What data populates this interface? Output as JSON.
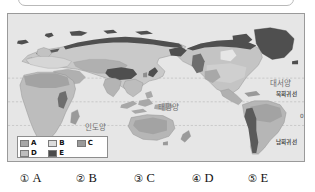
{
  "question_box": {
    "content": ""
  },
  "map": {
    "title_alt": "world-climate-distribution-map",
    "ocean_labels": [
      {
        "name": "pacific-ocean-label",
        "text": "태평양"
      },
      {
        "name": "indian-ocean-label",
        "text": "인도양"
      },
      {
        "name": "atlantic-ocean-label",
        "text": "대서양"
      }
    ],
    "latitude_labels": [
      {
        "name": "tropic-of-cancer-label",
        "text": "북회귀선"
      },
      {
        "name": "equator-label",
        "text": "0°"
      },
      {
        "name": "tropic-of-capricorn-label",
        "text": "남회귀선"
      }
    ],
    "legend": {
      "rows": [
        [
          {
            "label": "A",
            "color": "#a8a8a8"
          },
          {
            "label": "B",
            "color": "#dcdcdc"
          },
          {
            "label": "C",
            "color": "#9a9a9a"
          }
        ],
        [
          {
            "label": "D",
            "color": "#bdbdbd"
          },
          {
            "label": "E",
            "color": "#4a4a4a"
          },
          {
            "label": "",
            "color": ""
          }
        ]
      ]
    },
    "colors": {
      "ocean": "#e6e6e6",
      "land_light": "#dcdcdc",
      "land_mid": "#bdbdbd",
      "land_gray": "#a8a8a8",
      "land_dark_gray": "#9a9a9a",
      "land_darkest": "#4a4a4a",
      "frame": "#9a9a9a",
      "graticule": "#b4b4b4"
    }
  },
  "options": [
    {
      "num": "①",
      "label": "A"
    },
    {
      "num": "②",
      "label": "B"
    },
    {
      "num": "③",
      "label": "C"
    },
    {
      "num": "④",
      "label": "D"
    },
    {
      "num": "⑤",
      "label": "E"
    }
  ]
}
